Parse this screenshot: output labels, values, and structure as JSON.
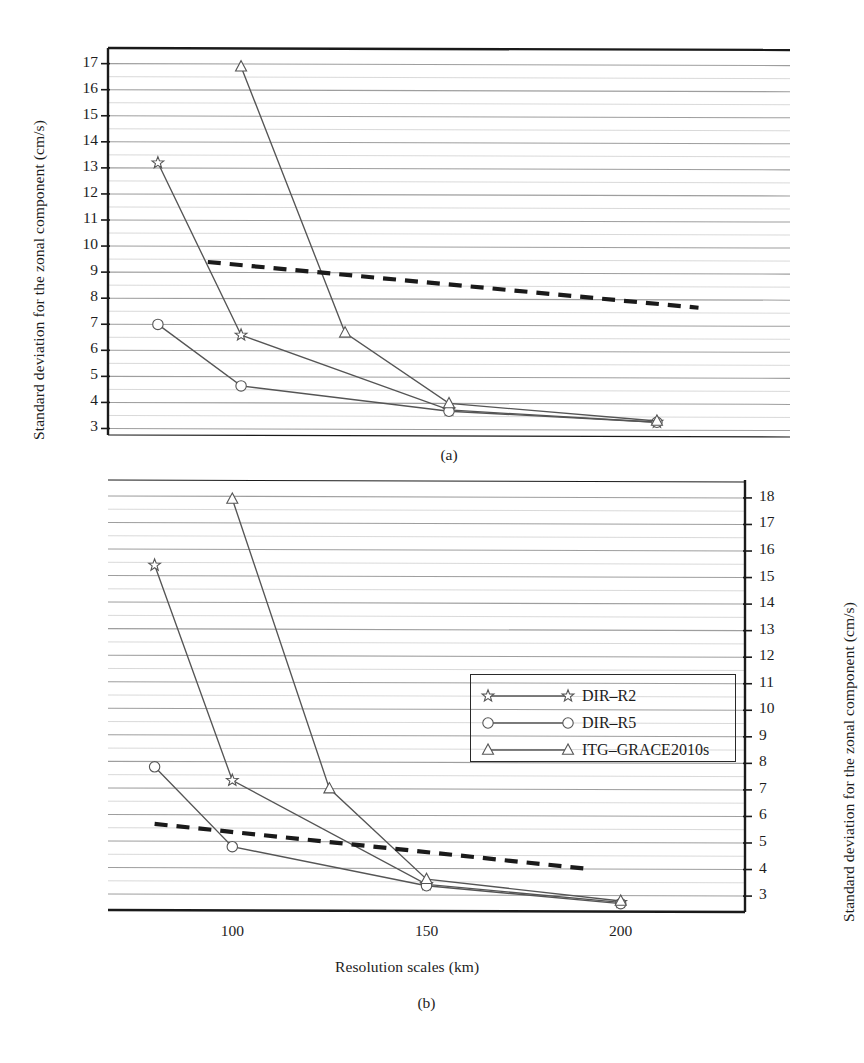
{
  "figure": {
    "panels": [
      {
        "id": "a",
        "sublabel": "(a)",
        "y_axis_title": "Standard deviation for the zonal component (cm/s)",
        "y_axis_side": "left",
        "x_axis_title": "",
        "y_ticks": [
          3,
          4,
          5,
          6,
          7,
          8,
          9,
          10,
          11,
          12,
          13,
          14,
          15,
          16,
          17
        ],
        "x_ticks": [
          100,
          150,
          200
        ],
        "x_tick_labels": [
          "100",
          "150",
          "200"
        ]
      },
      {
        "id": "b",
        "sublabel": "(b)",
        "y_axis_title": "Standard deviation for the zonal component (cm/s)",
        "y_axis_side": "right",
        "x_axis_title": "Resolution scales (km)",
        "y_ticks": [
          3,
          4,
          5,
          6,
          7,
          8,
          9,
          10,
          11,
          12,
          13,
          14,
          15,
          16,
          17,
          18
        ],
        "x_ticks": [
          100,
          150,
          200
        ],
        "x_tick_labels": [
          "100",
          "150",
          "200"
        ]
      }
    ]
  },
  "legend": {
    "position": "center-right-of-panel-b",
    "entries": [
      {
        "label": "DIR–R2",
        "marker": "star-marker",
        "color": "#555555"
      },
      {
        "label": "DIR–R5",
        "marker": "circle-marker",
        "color": "#555555"
      },
      {
        "label": "ITG–GRACE2010s",
        "marker": "triangle-marker",
        "color": "#555555"
      }
    ]
  },
  "colors": {
    "axis": "#1a1a1a",
    "gridline": "#8d8d8d",
    "series_line": "#555555",
    "trend_dashed": "#1a1a1a",
    "background": "#ffffff"
  },
  "chart_data": [
    {
      "type": "line",
      "panel": "a",
      "title": "",
      "subtitle": "(a)",
      "xlabel": "",
      "ylabel": "Standard deviation for the zonal component (cm/s)",
      "xlim": [
        68,
        232
      ],
      "ylim": [
        2.75,
        17.6
      ],
      "xticks": [
        100,
        150,
        200
      ],
      "yticks": [
        3,
        4,
        5,
        6,
        7,
        8,
        9,
        10,
        11,
        12,
        13,
        14,
        15,
        16,
        17
      ],
      "grid": true,
      "grid_axis": "y",
      "legend": "none-in-panel",
      "series": [
        {
          "name": "DIR–R2",
          "marker": "star",
          "x": [
            80,
            100,
            150,
            200
          ],
          "y": [
            13.2,
            6.6,
            3.75,
            3.3
          ]
        },
        {
          "name": "DIR–R5",
          "marker": "circle",
          "x": [
            80,
            100,
            150,
            200
          ],
          "y": [
            7.0,
            4.65,
            3.7,
            3.3
          ]
        },
        {
          "name": "ITG–GRACE2010s",
          "marker": "triangle",
          "x": [
            100,
            125,
            150,
            200
          ],
          "y": [
            16.9,
            6.7,
            4.0,
            3.35
          ]
        },
        {
          "name": "trend",
          "marker": "none",
          "linestyle": "dashed",
          "x": [
            92,
            210
          ],
          "y": [
            9.4,
            7.7
          ]
        }
      ]
    },
    {
      "type": "line",
      "panel": "b",
      "title": "",
      "subtitle": "(b)",
      "xlabel": "Resolution scales (km)",
      "ylabel": "Standard deviation for the zonal component (cm/s)",
      "xlim": [
        68,
        232
      ],
      "ylim": [
        2.4,
        18.6
      ],
      "xticks": [
        100,
        150,
        200
      ],
      "yticks": [
        3,
        4,
        5,
        6,
        7,
        8,
        9,
        10,
        11,
        12,
        13,
        14,
        15,
        16,
        17,
        18
      ],
      "grid": true,
      "grid_axis": "y",
      "legend": "inside-right",
      "series": [
        {
          "name": "DIR–R2",
          "marker": "star",
          "x": [
            80,
            100,
            150,
            200
          ],
          "y": [
            15.4,
            7.3,
            3.4,
            2.75
          ]
        },
        {
          "name": "DIR–R5",
          "marker": "circle",
          "x": [
            80,
            100,
            150,
            200
          ],
          "y": [
            7.8,
            4.8,
            3.35,
            2.7
          ]
        },
        {
          "name": "ITG–GRACE2010s",
          "marker": "triangle",
          "x": [
            100,
            125,
            150,
            200
          ],
          "y": [
            17.9,
            7.0,
            3.6,
            2.8
          ]
        },
        {
          "name": "trend",
          "marker": "none",
          "linestyle": "dashed",
          "x": [
            80,
            192
          ],
          "y": [
            5.65,
            4.0
          ]
        }
      ]
    }
  ]
}
